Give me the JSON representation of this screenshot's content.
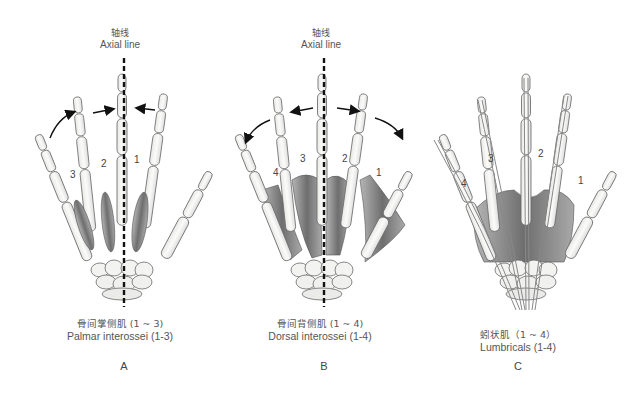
{
  "figure": {
    "panels": [
      {
        "id": "A",
        "letter": "A",
        "axis_label_zh": "轴线",
        "axis_label_en": "Axial line",
        "caption_zh": "骨间掌侧肌 (1 ~ 3)",
        "caption_en": "Palmar interossei (1-3)",
        "muscle_numbers": [
          "3",
          "2",
          "1"
        ],
        "arrows": "adduction toward axial line"
      },
      {
        "id": "B",
        "letter": "B",
        "axis_label_zh": "轴线",
        "axis_label_en": "Axial line",
        "caption_zh": "骨间背侧肌 (1 ~ 4)",
        "caption_en": "Dorsal interossei (1-4)",
        "muscle_numbers": [
          "4",
          "3",
          "2",
          "1"
        ],
        "arrows": "abduction away from axial line"
      },
      {
        "id": "C",
        "letter": "C",
        "caption_zh": "蚓状肌（1 ~ 4）",
        "caption_en": "Lumbricals (1-4)",
        "muscle_numbers": [
          "4",
          "3",
          "2",
          "1"
        ]
      }
    ],
    "colors": {
      "bone_fill": "#f7f7f5",
      "bone_stroke": "#6a6a6a",
      "muscle": "#8a8a8a",
      "axis_line": "#111111",
      "arrow": "#111111",
      "text": "#555555"
    }
  }
}
